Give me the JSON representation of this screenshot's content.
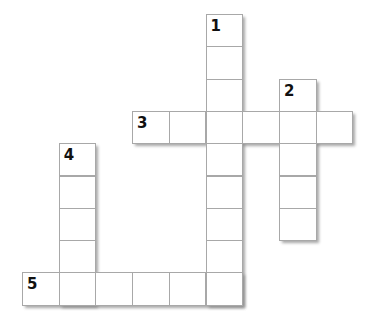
{
  "puzzle": {
    "type": "crossword",
    "grid": {
      "origin_x": 22,
      "origin_y": 14,
      "cell_w": 36.7,
      "cell_h": 32.3
    },
    "words": [
      {
        "number": "1",
        "direction": "down",
        "row": 0,
        "col": 5,
        "length": 9
      },
      {
        "number": "2",
        "direction": "down",
        "row": 2,
        "col": 7,
        "length": 5
      },
      {
        "number": "3",
        "direction": "across",
        "row": 3,
        "col": 3,
        "length": 6
      },
      {
        "number": "4",
        "direction": "down",
        "row": 4,
        "col": 1,
        "length": 5
      },
      {
        "number": "5",
        "direction": "across",
        "row": 8,
        "col": 0,
        "length": 6
      }
    ],
    "colors": {
      "cell_border": "#a8a8a8",
      "shadow": "#8a8a8a",
      "number": "#111111"
    }
  }
}
